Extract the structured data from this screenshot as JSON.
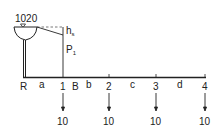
{
  "reservoir": {
    "elevation_label": "1020",
    "head_loss_label": "h",
    "head_loss_sub": "s",
    "pressure_label": "P",
    "pressure_sub": "1"
  },
  "nodes": [
    {
      "id": "R",
      "label": "R",
      "x": 24
    },
    {
      "id": "1",
      "label": "1",
      "x": 63,
      "demand": "10"
    },
    {
      "id": "2",
      "label": "2",
      "x": 109,
      "demand": "10"
    },
    {
      "id": "3",
      "label": "3",
      "x": 156,
      "demand": "10"
    },
    {
      "id": "4",
      "label": "4",
      "x": 205,
      "demand": "10"
    }
  ],
  "segments": [
    {
      "label": "a",
      "x": 42
    },
    {
      "label": "B",
      "x": 76
    },
    {
      "label": "b",
      "x": 89
    },
    {
      "label": "c",
      "x": 133
    },
    {
      "label": "d",
      "x": 180
    }
  ],
  "colors": {
    "line": "#222222",
    "dashed": "#555555"
  }
}
